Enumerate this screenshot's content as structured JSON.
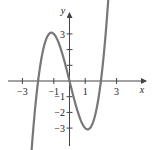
{
  "chart_data": {
    "type": "line",
    "title": "",
    "function": "y = x^3 - 4x",
    "xlabel": "x",
    "ylabel": "y",
    "xlim": [
      -4,
      4
    ],
    "ylim": [
      -4,
      4.5
    ],
    "x_ticks": [
      -3,
      -2,
      -1,
      0,
      1,
      2,
      3
    ],
    "x_tick_labels": [
      "-3",
      "-1",
      "1",
      "3"
    ],
    "y_ticks": [
      -3,
      -2,
      -1,
      1,
      2,
      3
    ],
    "y_tick_labels": [
      "3",
      "-1",
      "-2",
      "-3"
    ],
    "grid": false,
    "features": {
      "roots": [
        -2,
        0,
        2
      ],
      "local_max": [
        -1.15,
        3.08
      ],
      "local_min": [
        1.15,
        -3.08
      ]
    },
    "series": [
      {
        "name": "f(x)",
        "color": "#777777"
      }
    ]
  },
  "labels": {
    "x_axis": "x",
    "y_axis": "y",
    "xt_m3": "−3",
    "xt_m1": "−1",
    "xt_1": "1",
    "xt_3": "3",
    "yt_3": "3",
    "yt_m1": "−1",
    "yt_m2": "−2",
    "yt_m3": "−3"
  }
}
